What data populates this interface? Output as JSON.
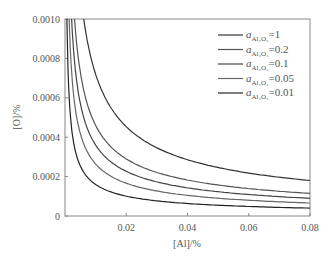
{
  "chart_data": {
    "type": "line",
    "title": "",
    "xlabel": "[Al]/%",
    "ylabel": "[O]/%",
    "xlim": [
      0,
      0.08
    ],
    "ylim": [
      0,
      0.001
    ],
    "xticks": [
      "0.02",
      "0.04",
      "0.06",
      "0.08"
    ],
    "yticks": [
      "0",
      "0.0002",
      "0.0004",
      "0.0006",
      "0.0008",
      "0.0010"
    ],
    "legend_position": "upper right",
    "grid": false,
    "series": [
      {
        "name": "a_Al2O3=1",
        "label": "=1",
        "x": [
          0.0059,
          0.01,
          0.02,
          0.04,
          0.06,
          0.08
        ],
        "values": [
          0.001,
          0.00072,
          0.000453,
          0.000286,
          0.000218,
          0.00018
        ]
      },
      {
        "name": "a_Al2O3=0.2",
        "label": "=0.2",
        "x": [
          0.003,
          0.01,
          0.02,
          0.04,
          0.06,
          0.08
        ],
        "values": [
          0.001,
          0.00046,
          0.00029,
          0.000182,
          0.000139,
          0.000115
        ]
      },
      {
        "name": "a_Al2O3=0.1",
        "label": "=0.1",
        "x": [
          0.0025,
          0.01,
          0.02,
          0.04,
          0.06,
          0.08
        ],
        "values": [
          0.001,
          0.00036,
          0.000227,
          0.000143,
          0.000109,
          9e-05
        ]
      },
      {
        "name": "a_Al2O3=0.05",
        "label": "=0.05",
        "x": [
          0.0018,
          0.01,
          0.02,
          0.04,
          0.06,
          0.08
        ],
        "values": [
          0.001,
          0.00026,
          0.000165,
          0.000104,
          7.9e-05,
          6.6e-05
        ]
      },
      {
        "name": "a_Al2O3=0.01",
        "label": "=0.01",
        "x": [
          0.0008,
          0.01,
          0.02,
          0.04,
          0.06,
          0.08
        ],
        "values": [
          0.001,
          0.00016,
          0.000101,
          6.4e-05,
          4.9e-05,
          4e-05
        ]
      }
    ]
  }
}
